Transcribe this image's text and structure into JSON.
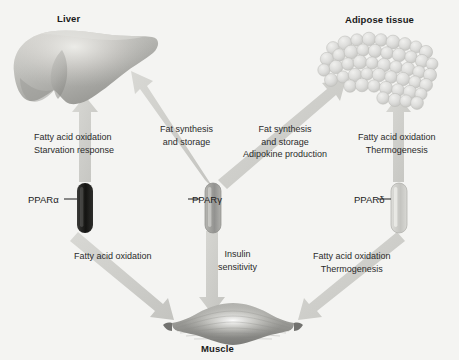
{
  "figure": {
    "type": "biological-pathway-diagram",
    "background_color": "#f4f4f2",
    "organs": [
      {
        "id": "liver",
        "label": "Liver",
        "icon": "liver-organ-icon"
      },
      {
        "id": "adipose",
        "label": "Adipose tissue",
        "icon": "adipose-tissue-icon"
      },
      {
        "id": "muscle",
        "label": "Muscle",
        "icon": "skeletal-muscle-icon"
      }
    ],
    "receptors": [
      {
        "id": "ppar_alpha",
        "label": "PPARα",
        "color": "#1c1c1c",
        "shade": "dark"
      },
      {
        "id": "ppar_gamma",
        "label": "PPARγ",
        "color": "#9c9c9a",
        "shade": "medium"
      },
      {
        "id": "ppar_delta",
        "label": "PPARδ",
        "color": "#c9c9c5",
        "shade": "light"
      }
    ],
    "arrow_color": "#cfcfcb",
    "flows": [
      {
        "id": "alpha_to_liver",
        "from": "ppar_alpha",
        "to": "liver",
        "direction": "up",
        "lines": [
          "Fatty acid oxidation",
          "Starvation response"
        ]
      },
      {
        "id": "gamma_to_liver",
        "from": "ppar_gamma",
        "to": "liver",
        "direction": "up-left",
        "lines": [
          "Fat synthesis",
          "and storage"
        ]
      },
      {
        "id": "gamma_to_adipose",
        "from": "ppar_gamma",
        "to": "adipose",
        "direction": "up-right",
        "lines": [
          "Fat synthesis",
          "and storage",
          "Adipokine production"
        ]
      },
      {
        "id": "delta_to_adipose",
        "from": "ppar_delta",
        "to": "adipose",
        "direction": "up",
        "lines": [
          "Fatty acid oxidation",
          "Thermogenesis"
        ]
      },
      {
        "id": "alpha_to_muscle",
        "from": "ppar_alpha",
        "to": "muscle",
        "direction": "down-right",
        "lines": [
          "Fatty acid oxidation"
        ]
      },
      {
        "id": "gamma_to_muscle",
        "from": "ppar_gamma",
        "to": "muscle",
        "direction": "down",
        "lines": [
          "Insulin",
          "sensitivity"
        ]
      },
      {
        "id": "delta_to_muscle",
        "from": "ppar_delta",
        "to": "muscle",
        "direction": "down-left",
        "lines": [
          "Fatty acid oxidation",
          "Thermogenesis"
        ]
      }
    ]
  }
}
